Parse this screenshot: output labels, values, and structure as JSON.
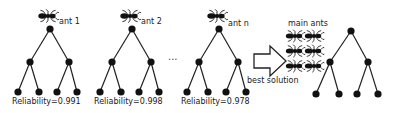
{
  "colors": {
    "line": "#222222",
    "node": "#111111",
    "text": "#1a1a1a",
    "background": "#ffffff"
  },
  "trees": [
    {
      "id": "tree-ant-1",
      "ant_label": "ant 1",
      "reliability_label": "Reliability=0.991",
      "reliability": 0.991
    },
    {
      "id": "tree-ant-2",
      "ant_label": "ant 2",
      "reliability_label": "Reliability=0.998",
      "reliability": 0.998
    },
    {
      "id": "tree-ant-n",
      "ant_label": "ant n",
      "reliability_label": "Reliability=0.978",
      "reliability": 0.978
    }
  ],
  "ellipsis": "...",
  "arrow": {
    "label": "best solution",
    "icon": "block-arrow-right-icon"
  },
  "main_ants": {
    "label": "main ants",
    "count": 6,
    "icon": "ant-icon"
  },
  "result_tree": {
    "id": "best-solution-tree"
  }
}
